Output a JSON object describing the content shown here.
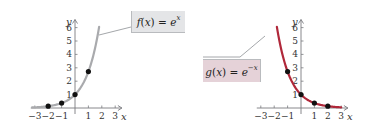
{
  "chart_data": [
    {
      "type": "line",
      "title": "",
      "function_label": "f(x) = e^x",
      "label_parts": {
        "fname": "f",
        "var": "x",
        "base": "e",
        "exponent": "x"
      },
      "xlabel": "x",
      "ylabel": "y",
      "xlim": [
        -3.3,
        3.5
      ],
      "ylim": [
        0,
        6.5
      ],
      "x_ticks": [
        "−3",
        "−2",
        "−1",
        "1",
        "2",
        "3"
      ],
      "y_ticks": [
        "1",
        "2",
        "3",
        "4",
        "5",
        "6"
      ],
      "curve_color": "#a9aaad",
      "label_box_color": "#e4e5e7",
      "grid": false,
      "points": [
        {
          "x": -2,
          "y": 0.135
        },
        {
          "x": -1,
          "y": 0.368
        },
        {
          "x": 0,
          "y": 1
        },
        {
          "x": 1,
          "y": 2.718
        }
      ],
      "domain": [
        -3.2,
        1.8
      ]
    },
    {
      "type": "line",
      "title": "",
      "function_label": "g(x) = e^−x",
      "label_parts": {
        "fname": "g",
        "var": "x",
        "base": "e",
        "exponent": "−x"
      },
      "xlabel": "x",
      "ylabel": "y",
      "xlim": [
        -3.3,
        3.5
      ],
      "ylim": [
        0,
        6.5
      ],
      "x_ticks": [
        "−3",
        "−2",
        "−1",
        "1",
        "2",
        "3"
      ],
      "y_ticks": [
        "1",
        "2",
        "3",
        "4",
        "5",
        "6"
      ],
      "curve_color": "#b0283a",
      "label_box_color": "#e5d2d8",
      "grid": false,
      "points": [
        {
          "x": -1,
          "y": 2.718
        },
        {
          "x": 0,
          "y": 1
        },
        {
          "x": 1,
          "y": 0.368
        },
        {
          "x": 2,
          "y": 0.135
        }
      ],
      "domain": [
        -1.8,
        3.0
      ]
    }
  ]
}
